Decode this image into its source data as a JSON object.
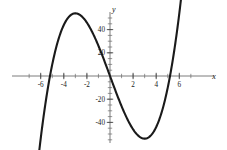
{
  "figure": {
    "background_color": "#ffffff",
    "curve_color": "#1a1a1a",
    "axis_color": "#5a5a5a",
    "width": 227,
    "height": 150
  },
  "axes": {
    "x_axis_label": "x",
    "y_axis_label": "y",
    "x_tick_labels": [
      "-6",
      "-4",
      "-2",
      "2",
      "4",
      "6"
    ],
    "y_tick_labels": [
      "40",
      "20",
      "-20",
      "-40"
    ]
  },
  "chart_data": {
    "type": "line",
    "title": "",
    "subtitle": "",
    "xlabel": "x",
    "ylabel": "y",
    "grid": false,
    "legend": null,
    "xlim": [
      -7.2,
      7.2
    ],
    "ylim": [
      -62,
      58
    ],
    "xticks": [
      -6,
      -4,
      -2,
      2,
      4,
      6
    ],
    "yticks": [
      40,
      20,
      -20,
      -40
    ],
    "x_minor_tick_step": 1,
    "y_minor_tick_step": 5,
    "function": "y = x^3 - 27x",
    "annotations": [],
    "features": {
      "local_maximum": {
        "x": -3,
        "y": 19.5
      },
      "local_minimum": {
        "x": 3,
        "y": -19.5
      },
      "roots": [
        -5.2,
        0,
        5.2
      ],
      "inflection": {
        "x": 0,
        "y": 0
      }
    },
    "series": [
      {
        "name": "cubic",
        "x": [
          -6.4,
          -6.2,
          -6.0,
          -5.8,
          -5.6,
          -5.4,
          -5.2,
          -5.0,
          -4.8,
          -4.6,
          -4.4,
          -4.2,
          -4.0,
          -3.8,
          -3.6,
          -3.4,
          -3.2,
          -3.0,
          -2.8,
          -2.6,
          -2.4,
          -2.2,
          -2.0,
          -1.8,
          -1.6,
          -1.4,
          -1.2,
          -1.0,
          -0.8,
          -0.6,
          -0.4,
          -0.2,
          0.0,
          0.2,
          0.4,
          0.6,
          0.8,
          1.0,
          1.2,
          1.4,
          1.6,
          1.8,
          2.0,
          2.2,
          2.4,
          2.6,
          2.8,
          3.0,
          3.2,
          3.4,
          3.6,
          3.8,
          4.0,
          4.2,
          4.4,
          4.6,
          4.8,
          5.0,
          5.2,
          5.4,
          5.6,
          5.8,
          6.0,
          6.2,
          6.4,
          6.6,
          6.8,
          7.0
        ],
        "y": [
          -89.2,
          -70.9,
          -54.0,
          -38.5,
          -24.4,
          -11.8,
          -0.5,
          9.5,
          18.1,
          27.0,
          33.6,
          39.3,
          44.0,
          47.5,
          50.1,
          51.3,
          51.4,
          50.4,
          48.2,
          44.8,
          40.4,
          34.9,
          28.4,
          21.0,
          12.7,
          3.6,
          -6.0,
          -16.3,
          -27.1,
          -38.4,
          -50.1,
          -66.1,
          0.0,
          0.0,
          0.0,
          0.0,
          0.0,
          0.0,
          0.0,
          0.0,
          0.0,
          0.0,
          0.0,
          0.0,
          0.0,
          0.0,
          0.0,
          0.0,
          0.0,
          0.0,
          0.0,
          0.0,
          0.0,
          0.0,
          0.0,
          0.0,
          0.0,
          0.0,
          0.0,
          0.0,
          0.0,
          0.0,
          0.0,
          0.0,
          0.0,
          0.0,
          0.0,
          0.0
        ]
      }
    ]
  }
}
